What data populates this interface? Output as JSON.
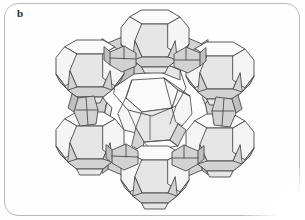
{
  "figure": {
    "panel_label": "b",
    "caption_visible": false,
    "border": {
      "color": "#b9b9b9",
      "radius_px": 14,
      "style": "rounded-rectangle-outline"
    },
    "background_color": "#fefefe"
  },
  "illustration": {
    "name": "zeolite-framework-diagram",
    "subject": "faujasite (zeolite Y) framework",
    "description": "Polyhedral wireframe model of sodalite cages (truncated octahedra) joined by hexagonal prisms around a central supercage pore",
    "render_style": "line-art-with-flat-shading",
    "colors": {
      "outline": "#4a4a4a",
      "face_light": "#f4f4f4",
      "face_mid": "#e4e4e4",
      "face_shadow": "#cfcfcf",
      "face_dark": "#bdbdbd"
    },
    "units": [
      {
        "id": "cage-top",
        "role": "sodalite-cage",
        "cx": 155,
        "cy": 38
      },
      {
        "id": "cage-upper-left",
        "role": "sodalite-cage",
        "cx": 92,
        "cy": 70
      },
      {
        "id": "cage-upper-right",
        "role": "sodalite-cage",
        "cx": 218,
        "cy": 72
      },
      {
        "id": "cage-lower-left",
        "role": "sodalite-cage",
        "cx": 92,
        "cy": 140
      },
      {
        "id": "cage-lower-right",
        "role": "sodalite-cage",
        "cx": 218,
        "cy": 142
      },
      {
        "id": "cage-bottom",
        "role": "sodalite-cage",
        "cx": 155,
        "cy": 176
      },
      {
        "id": "cage-center-rear",
        "role": "sodalite-cage",
        "cx": 158,
        "cy": 108
      },
      {
        "id": "prism-ul",
        "role": "hexagonal-prism",
        "cx": 122,
        "cy": 52
      },
      {
        "id": "prism-ur",
        "role": "hexagonal-prism",
        "cx": 188,
        "cy": 53
      },
      {
        "id": "prism-l",
        "role": "hexagonal-prism",
        "cx": 90,
        "cy": 106
      },
      {
        "id": "prism-r",
        "role": "hexagonal-prism",
        "cx": 220,
        "cy": 107
      },
      {
        "id": "prism-ll",
        "role": "hexagonal-prism",
        "cx": 122,
        "cy": 160
      },
      {
        "id": "prism-lr",
        "role": "hexagonal-prism",
        "cx": 188,
        "cy": 161
      }
    ],
    "pore": {
      "id": "supercage-pore",
      "role": "12-ring-window",
      "cx": 148,
      "cy": 90,
      "rx": 34,
      "ry": 27
    }
  }
}
